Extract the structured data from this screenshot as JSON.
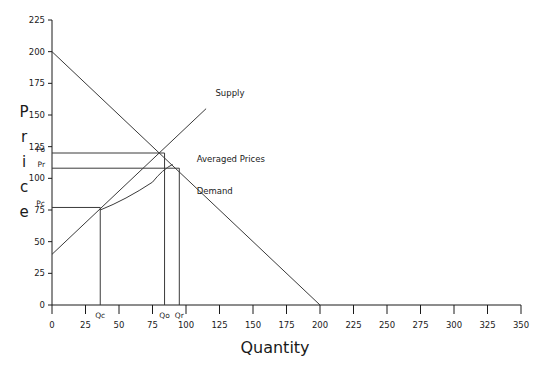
{
  "chart_data": {
    "type": "line",
    "title": "",
    "xlabel": "Quantity",
    "ylabel": "Price",
    "xlim": [
      0,
      350
    ],
    "ylim": [
      0,
      225
    ],
    "grid": false,
    "legend_position": "inline-annotations",
    "x_ticks": [
      0,
      25,
      50,
      75,
      100,
      125,
      150,
      175,
      200,
      225,
      250,
      275,
      300,
      325,
      350
    ],
    "y_ticks": [
      0,
      25,
      50,
      75,
      100,
      125,
      150,
      175,
      200,
      225
    ],
    "series": [
      {
        "name": "Supply",
        "kind": "line",
        "points": [
          [
            0,
            40
          ],
          [
            115,
            155
          ]
        ],
        "label": "Supply",
        "label_x": 122,
        "label_y": 165
      },
      {
        "name": "Demand",
        "kind": "line",
        "points": [
          [
            0,
            200
          ],
          [
            200,
            0
          ]
        ],
        "label": "Demand",
        "label_x": 108,
        "label_y": 88
      },
      {
        "name": "Averaged Prices",
        "kind": "curve",
        "points": [
          [
            36,
            75
          ],
          [
            55,
            83
          ],
          [
            75,
            97
          ],
          [
            90,
            111
          ]
        ],
        "label": "Averaged Prices",
        "label_x": 108,
        "label_y": 113
      }
    ],
    "annotations": [
      {
        "name": "Po",
        "axis": "y",
        "value": 120,
        "label": "Po"
      },
      {
        "name": "Pr",
        "axis": "y",
        "value": 108,
        "label": "Pr"
      },
      {
        "name": "Pc",
        "axis": "y",
        "value": 77,
        "label": "Pc"
      },
      {
        "name": "Qc",
        "axis": "x",
        "value": 36,
        "label": "Qc"
      },
      {
        "name": "Qo",
        "axis": "x",
        "value": 84,
        "label": "Qo"
      },
      {
        "name": "Qr",
        "axis": "x",
        "value": 95,
        "label": "Qr"
      }
    ],
    "equilibria": [
      {
        "name": "competitive",
        "x": 36,
        "y": 77
      },
      {
        "name": "optimal",
        "x": 84,
        "y": 120
      },
      {
        "name": "regulated",
        "x": 95,
        "y": 108
      }
    ]
  },
  "axes": {
    "y_title_letters": [
      "P",
      "r",
      "i",
      "c",
      "e"
    ],
    "x_title": "Quantity"
  },
  "colors": {
    "ink": "#1a1a1a",
    "line": "#3a3a3a",
    "background": "#ffffff"
  }
}
